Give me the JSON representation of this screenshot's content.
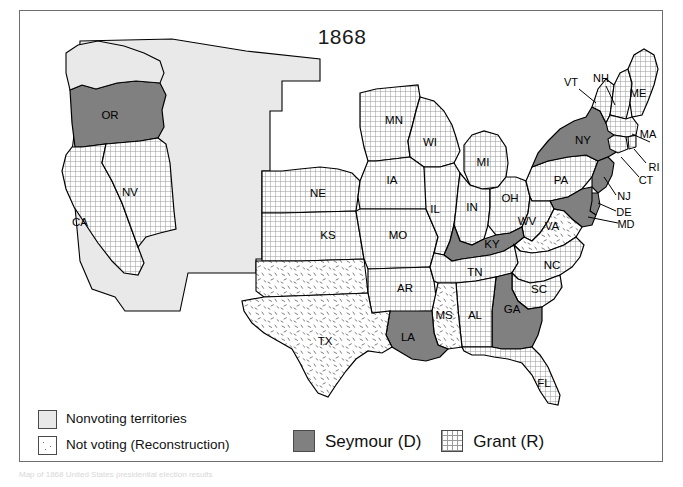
{
  "figure": {
    "title": "1868",
    "caption": "Map of 1868 United States presidential election results"
  },
  "legend": {
    "items": [
      {
        "id": "nonvoting",
        "label": "Nonvoting territories",
        "fill": "nonvoting",
        "color": "#e9e9e9"
      },
      {
        "id": "reconstruction",
        "label": "Not voting (Reconstruction)",
        "fill": "reconstruction",
        "color": "#ffffff"
      },
      {
        "id": "seymour",
        "label": "Seymour (D)",
        "fill": "seymour",
        "color": "#808080"
      },
      {
        "id": "grant",
        "label": "Grant (R)",
        "fill": "grant",
        "color": "#f2f2f2"
      }
    ]
  },
  "chart_data": {
    "type": "map",
    "title": "1868",
    "map_subject": "United States presidential election 1868 by state",
    "categories": [
      "Nonvoting territories",
      "Not voting (Reconstruction)",
      "Seymour (D)",
      "Grant (R)"
    ],
    "colors": {
      "nonvoting": "#e9e9e9",
      "reconstruction": "#ffffff",
      "seymour": "#808080",
      "grant": "#f2f2f2",
      "outline": "#000000",
      "frame": "#6d6d6d"
    },
    "states": [
      {
        "code": "OR",
        "name": "Oregon",
        "result": "seymour"
      },
      {
        "code": "CA",
        "name": "California",
        "result": "grant"
      },
      {
        "code": "NV",
        "name": "Nevada",
        "result": "grant"
      },
      {
        "code": "NE",
        "name": "Nebraska",
        "result": "grant"
      },
      {
        "code": "KS",
        "name": "Kansas",
        "result": "grant"
      },
      {
        "code": "MN",
        "name": "Minnesota",
        "result": "grant"
      },
      {
        "code": "IA",
        "name": "Iowa",
        "result": "grant"
      },
      {
        "code": "MO",
        "name": "Missouri",
        "result": "grant"
      },
      {
        "code": "AR",
        "name": "Arkansas",
        "result": "grant"
      },
      {
        "code": "WI",
        "name": "Wisconsin",
        "result": "grant"
      },
      {
        "code": "IL",
        "name": "Illinois",
        "result": "grant"
      },
      {
        "code": "MI",
        "name": "Michigan",
        "result": "grant"
      },
      {
        "code": "IN",
        "name": "Indiana",
        "result": "grant"
      },
      {
        "code": "OH",
        "name": "Ohio",
        "result": "grant"
      },
      {
        "code": "KY",
        "name": "Kentucky",
        "result": "seymour"
      },
      {
        "code": "TN",
        "name": "Tennessee",
        "result": "grant"
      },
      {
        "code": "MS",
        "name": "Mississippi",
        "result": "reconstruction"
      },
      {
        "code": "AL",
        "name": "Alabama",
        "result": "grant"
      },
      {
        "code": "GA",
        "name": "Georgia",
        "result": "seymour"
      },
      {
        "code": "FL",
        "name": "Florida",
        "result": "grant"
      },
      {
        "code": "SC",
        "name": "South Carolina",
        "result": "grant"
      },
      {
        "code": "NC",
        "name": "North Carolina",
        "result": "grant"
      },
      {
        "code": "VA",
        "name": "Virginia",
        "result": "reconstruction"
      },
      {
        "code": "WV",
        "name": "West Virginia",
        "result": "grant"
      },
      {
        "code": "MD",
        "name": "Maryland",
        "result": "seymour"
      },
      {
        "code": "DE",
        "name": "Delaware",
        "result": "seymour"
      },
      {
        "code": "NJ",
        "name": "New Jersey",
        "result": "seymour"
      },
      {
        "code": "PA",
        "name": "Pennsylvania",
        "result": "grant"
      },
      {
        "code": "NY",
        "name": "New York",
        "result": "seymour"
      },
      {
        "code": "CT",
        "name": "Connecticut",
        "result": "grant"
      },
      {
        "code": "RI",
        "name": "Rhode Island",
        "result": "grant"
      },
      {
        "code": "MA",
        "name": "Massachusetts",
        "result": "grant"
      },
      {
        "code": "VT",
        "name": "Vermont",
        "result": "grant"
      },
      {
        "code": "NH",
        "name": "New Hampshire",
        "result": "grant"
      },
      {
        "code": "ME",
        "name": "Maine",
        "result": "grant"
      },
      {
        "code": "LA",
        "name": "Louisiana",
        "result": "seymour"
      },
      {
        "code": "TX",
        "name": "Texas",
        "result": "reconstruction"
      }
    ],
    "labels": [
      {
        "code": "OR",
        "x": 90,
        "y": 105
      },
      {
        "code": "NV",
        "x": 110,
        "y": 182
      },
      {
        "code": "CA",
        "x": 60,
        "y": 212
      },
      {
        "code": "NE",
        "x": 298,
        "y": 183
      },
      {
        "code": "KS",
        "x": 308,
        "y": 225
      },
      {
        "code": "MN",
        "x": 374,
        "y": 110
      },
      {
        "code": "WI",
        "x": 410,
        "y": 132
      },
      {
        "code": "IA",
        "x": 372,
        "y": 170
      },
      {
        "code": "MO",
        "x": 378,
        "y": 225
      },
      {
        "code": "AR",
        "x": 385,
        "y": 278
      },
      {
        "code": "IL",
        "x": 415,
        "y": 199
      },
      {
        "code": "MI",
        "x": 463,
        "y": 152
      },
      {
        "code": "IN",
        "x": 452,
        "y": 197
      },
      {
        "code": "OH",
        "x": 490,
        "y": 188
      },
      {
        "code": "KY",
        "x": 472,
        "y": 234
      },
      {
        "code": "TN",
        "x": 455,
        "y": 262
      },
      {
        "code": "MS",
        "x": 424,
        "y": 305
      },
      {
        "code": "AL",
        "x": 455,
        "y": 305
      },
      {
        "code": "GA",
        "x": 492,
        "y": 299
      },
      {
        "code": "FL",
        "x": 524,
        "y": 373
      },
      {
        "code": "SC",
        "x": 519,
        "y": 279
      },
      {
        "code": "NC",
        "x": 532,
        "y": 255
      },
      {
        "code": "VA",
        "x": 532,
        "y": 216
      },
      {
        "code": "WV",
        "x": 507,
        "y": 211
      },
      {
        "code": "PA",
        "x": 541,
        "y": 170
      },
      {
        "code": "NY",
        "x": 563,
        "y": 130
      },
      {
        "code": "TX",
        "x": 305,
        "y": 331
      },
      {
        "code": "LA",
        "x": 388,
        "y": 327
      }
    ],
    "leader_labels": [
      {
        "code": "VT",
        "x": 551,
        "y": 72
      },
      {
        "code": "NH",
        "x": 581,
        "y": 68
      },
      {
        "code": "ME",
        "x": 618,
        "y": 83
      },
      {
        "code": "MA",
        "x": 628,
        "y": 124
      },
      {
        "code": "RI",
        "x": 634,
        "y": 157
      },
      {
        "code": "CT",
        "x": 626,
        "y": 170
      },
      {
        "code": "NJ",
        "x": 604,
        "y": 186
      },
      {
        "code": "DE",
        "x": 604,
        "y": 202
      },
      {
        "code": "MD",
        "x": 606,
        "y": 214
      }
    ]
  }
}
